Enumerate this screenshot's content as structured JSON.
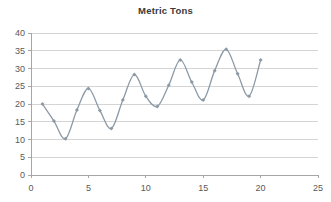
{
  "chart_data": {
    "type": "line",
    "title": "Metric Tons",
    "xlabel": "",
    "ylabel": "",
    "xlim": [
      0,
      25
    ],
    "ylim": [
      0,
      40
    ],
    "x_ticks": [
      0,
      5,
      10,
      15,
      20,
      25
    ],
    "y_ticks": [
      0,
      5,
      10,
      15,
      20,
      25,
      30,
      35,
      40
    ],
    "grid": "horizontal",
    "legend": "none",
    "smoothed": true,
    "marker": "diamond",
    "series": [
      {
        "name": "Metric Tons",
        "color": "#8c9aa6",
        "x": [
          1,
          2,
          3,
          4,
          5,
          6,
          7,
          8,
          9,
          10,
          11,
          12,
          13,
          14,
          15,
          16,
          17,
          18,
          19,
          20
        ],
        "values": [
          20.0,
          15.2,
          10.2,
          18.3,
          24.4,
          18.2,
          13.1,
          21.1,
          28.3,
          22.2,
          19.3,
          25.3,
          32.4,
          26.2,
          21.1,
          29.4,
          35.4,
          28.5,
          22.2,
          32.4
        ]
      }
    ]
  },
  "style": {
    "line_color": "#8c9aa6",
    "grid_color": "#d4d4d4",
    "axis_color": "#a6a6a6",
    "text_color": "#595959",
    "title_color": "#3a3a3a",
    "background": "#ffffff"
  }
}
